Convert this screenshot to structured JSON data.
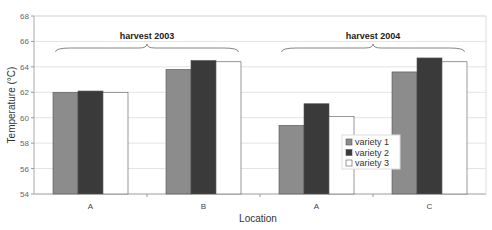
{
  "chart_data": {
    "type": "bar",
    "title": "",
    "xlabel": "Location",
    "ylabel": "Temperature (°C)",
    "ylim": [
      54,
      68
    ],
    "yticks": [
      54,
      56,
      58,
      60,
      62,
      64,
      66,
      68
    ],
    "grid": true,
    "legend_position": "inside-right",
    "categories": [
      "A",
      "B",
      "A",
      "C"
    ],
    "groups": [
      {
        "label": "harvest 2003",
        "categories": [
          0,
          1
        ]
      },
      {
        "label": "harvest 2004",
        "categories": [
          2,
          3
        ]
      }
    ],
    "series": [
      {
        "name": "variety 1",
        "color": "#8c8c8c",
        "values": [
          62.0,
          63.8,
          59.4,
          63.6
        ]
      },
      {
        "name": "variety 2",
        "color": "#3a3a3a",
        "values": [
          62.1,
          64.5,
          61.1,
          64.7
        ]
      },
      {
        "name": "variety 3",
        "color": "#ffffff",
        "values": [
          62.0,
          64.4,
          60.1,
          64.4
        ]
      }
    ]
  }
}
